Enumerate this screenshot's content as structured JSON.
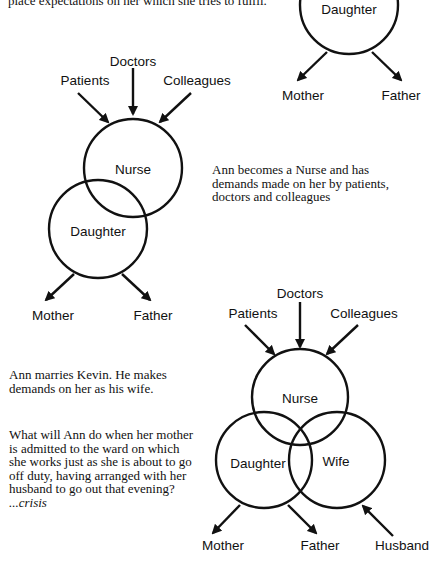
{
  "intro_text": {
    "line": "place expectations on her which she tries to fulfil."
  },
  "diagram1": {
    "circle": "Daughter",
    "outputs": [
      "Mother",
      "Father"
    ]
  },
  "diagram2": {
    "inputs": [
      "Patients",
      "Doctors",
      "Colleagues"
    ],
    "circles": [
      "Nurse",
      "Daughter"
    ],
    "outputs": [
      "Mother",
      "Father"
    ],
    "caption": [
      "Ann becomes a Nurse and has",
      "demands made on her by patients,",
      "doctors and colleagues"
    ]
  },
  "diagram3": {
    "inputs": [
      "Patients",
      "Doctors",
      "Colleagues"
    ],
    "circles": [
      "Nurse",
      "Daughter",
      "Wife"
    ],
    "outputs": [
      "Mother",
      "Father"
    ],
    "extra_input": "Husband",
    "caption_marriage": [
      "Ann marries Kevin. He makes",
      "demands on her as his wife."
    ],
    "caption_question": [
      "What will Ann do when her mother",
      "is admitted to the ward on which",
      "she works just as she is about to go",
      "off duty, having arranged with her",
      "husband to go out that evening?"
    ],
    "crisis": "...crisis"
  },
  "colors": {
    "ink": "#111111",
    "background": "#ffffff"
  }
}
